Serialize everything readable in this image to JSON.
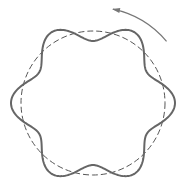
{
  "diagram": {
    "description": "Six-lobed wavy ring overlaid on a dashed reference circle with a counterclockwise rotation arrow",
    "center": [
      93,
      103
    ],
    "reference_circle": {
      "radius": 72,
      "style": "dashed",
      "color": "#555555"
    },
    "wavy_ring": {
      "base_radius": 72,
      "amplitude": 10,
      "lobes": 6,
      "phase_deg": 0,
      "color": "#666666",
      "stroke_width": 2
    },
    "rotation_arrow": {
      "radius": 96,
      "start_deg": -40,
      "end_deg": -78,
      "direction": "counterclockwise",
      "color": "#777777"
    }
  }
}
